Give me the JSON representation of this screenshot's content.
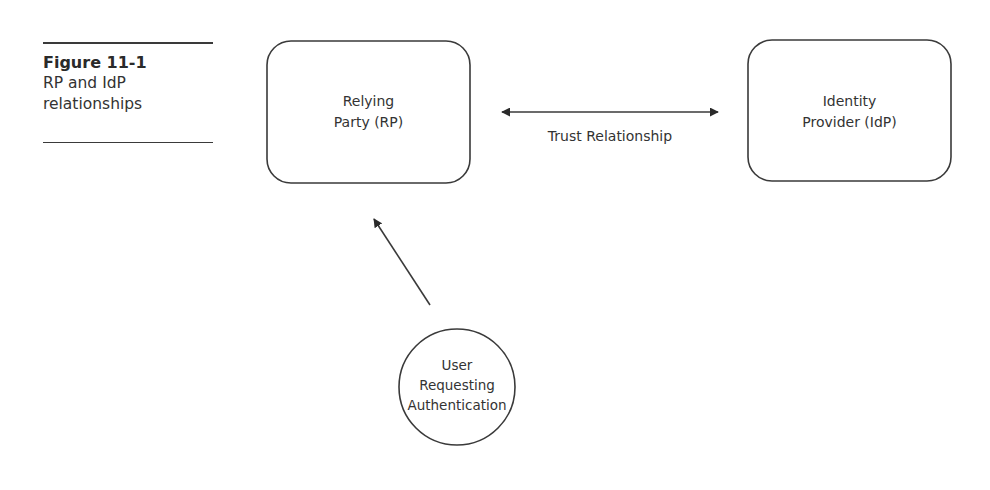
{
  "figure": {
    "number": "Figure 11-1",
    "caption": "RP and IdP relationships",
    "caption_lines": [
      "RP and IdP",
      "relationships"
    ]
  },
  "nodes": {
    "relying_party": {
      "lines": [
        "Relying",
        "Party (RP)"
      ],
      "shape": "rounded-rectangle"
    },
    "identity_provider": {
      "lines": [
        "Identity",
        "Provider (IdP)"
      ],
      "shape": "rounded-rectangle"
    },
    "user": {
      "lines": [
        "User",
        "Requesting",
        "Authentication"
      ],
      "shape": "circle"
    }
  },
  "edges": {
    "trust": {
      "from": "Relying Party (RP)",
      "to": "Identity Provider (IdP)",
      "direction": "bidirectional",
      "label": "Trust Relationship"
    },
    "auth_request": {
      "from": "User Requesting Authentication",
      "to": "Relying Party (RP)",
      "direction": "forward",
      "label": ""
    }
  },
  "colors": {
    "stroke": "#3a3a3a",
    "text": "#333333",
    "background": "#ffffff"
  }
}
